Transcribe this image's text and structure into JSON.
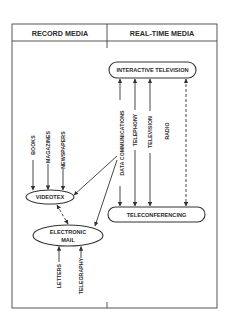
{
  "diagram": {
    "columns": {
      "left": "RECORD MEDIA",
      "right": "REAL-TIME MEDIA"
    },
    "nodes": {
      "interactive_tv": "INTERACTIVE TELEVISION",
      "teleconferencing": "TELECONFERENCING",
      "videotex": "VIDEOTEX",
      "email_line1": "ELECTRONIC",
      "email_line2": "MAIL"
    },
    "inputs": {
      "books": "BOOKS",
      "magazines": "MAGAZINES",
      "newspapers": "NEWSPAPERS",
      "letters": "LETTERS",
      "telegraphy": "TELEGRAPHY",
      "data_communications": "DATA COMMUNICATIONS",
      "telephony": "TELEPHONY",
      "television": "TELEVISION",
      "radio": "RADIO"
    },
    "colors": {
      "ink": "#333333",
      "background": "#ffffff"
    }
  }
}
